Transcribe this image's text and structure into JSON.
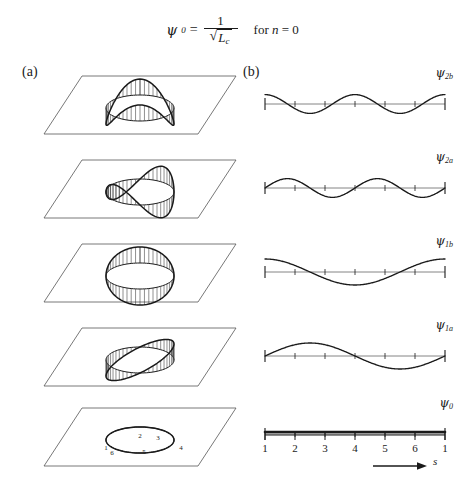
{
  "equation": {
    "lhs_symbol": "ψ",
    "lhs_subscript": "0",
    "equals": "=",
    "numerator": "1",
    "denominator_radicand": "L",
    "denominator_radicand_sub": "c",
    "condition": "for",
    "condition_var": "n",
    "condition_equals": "=",
    "condition_value": "0"
  },
  "panels": {
    "a_label": "(a)",
    "b_label": "(b)"
  },
  "colors": {
    "ink": "#1a1a1a",
    "plane_line": "#555555",
    "hatch": "#333333",
    "baseline": "#777777"
  },
  "rows": [
    {
      "index": 0,
      "wave_label_symbol": "ψ",
      "wave_label_sub": "2b",
      "mode_n": 2,
      "mode_phase": "b",
      "description": "two-period cosine mode shape"
    },
    {
      "index": 1,
      "wave_label_symbol": "ψ",
      "wave_label_sub": "2a",
      "mode_n": 2,
      "mode_phase": "a",
      "description": "two-period sine mode shape"
    },
    {
      "index": 2,
      "wave_label_symbol": "ψ",
      "wave_label_sub": "1b",
      "mode_n": 1,
      "mode_phase": "b",
      "description": "one-period cosine mode shape"
    },
    {
      "index": 3,
      "wave_label_symbol": "ψ",
      "wave_label_sub": "1a",
      "mode_n": 1,
      "mode_phase": "a",
      "description": "one-period sine mode shape"
    },
    {
      "index": 4,
      "wave_label_symbol": "ψ",
      "wave_label_sub": "0",
      "mode_n": 0,
      "mode_phase": "",
      "description": "uniform constant mode shape"
    }
  ],
  "axis": {
    "tick_labels": [
      "1",
      "2",
      "3",
      "4",
      "5",
      "6",
      "1"
    ],
    "arrow_label": "s"
  },
  "hexagon_vertices": {
    "labels": [
      "1",
      "2",
      "3",
      "4",
      "5",
      "6"
    ]
  },
  "chart_data": {
    "type": "line",
    "title": "",
    "xlabel": "s",
    "ylabel": "",
    "x": [
      1,
      2,
      3,
      4,
      5,
      6,
      7
    ],
    "xtick_labels": [
      "1",
      "2",
      "3",
      "4",
      "5",
      "6",
      "1"
    ],
    "xlim": [
      1,
      7
    ],
    "grid": false,
    "legend": "right-aligned inline labels",
    "series": [
      {
        "name": "ψ2b",
        "form": "cos(2·2π·(s-1)/6)",
        "amplitude": 1.0,
        "periods": 2,
        "values": [
          1.0,
          -0.5,
          -0.5,
          1.0,
          -0.5,
          -0.5,
          1.0
        ]
      },
      {
        "name": "ψ2a",
        "form": "sin(2·2π·(s-1)/6)",
        "amplitude": 1.0,
        "periods": 2,
        "values": [
          0.0,
          0.866,
          -0.866,
          0.0,
          0.866,
          -0.866,
          0.0
        ]
      },
      {
        "name": "ψ1b",
        "form": "cos(1·2π·(s-1)/6)",
        "amplitude": 1.0,
        "periods": 1,
        "values": [
          1.0,
          0.5,
          -0.5,
          -1.0,
          -0.5,
          0.5,
          1.0
        ]
      },
      {
        "name": "ψ1a",
        "form": "sin(1·2π·(s-1)/6)",
        "amplitude": 1.0,
        "periods": 1,
        "values": [
          0.0,
          0.866,
          0.866,
          0.0,
          -0.866,
          -0.866,
          0.0
        ]
      },
      {
        "name": "ψ0",
        "form": "constant",
        "amplitude": 0.0,
        "periods": 0,
        "values": [
          0.0,
          0.0,
          0.0,
          0.0,
          0.0,
          0.0,
          0.0
        ]
      }
    ]
  }
}
